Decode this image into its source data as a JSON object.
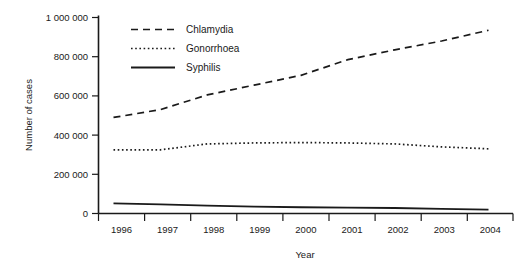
{
  "chart_data": {
    "type": "line",
    "title": "",
    "xlabel": "Year",
    "ylabel": "Number of cases",
    "x": [
      1996,
      1997,
      1998,
      1999,
      2000,
      2001,
      2002,
      2003,
      2004
    ],
    "xtick_labels": [
      "1996",
      "1997",
      "1998",
      "1999",
      "2000",
      "2001",
      "2002",
      "2003",
      "2004"
    ],
    "ytick_labels": [
      "0",
      "200 000",
      "400 000",
      "600 000",
      "800 000",
      "1 000 000"
    ],
    "ytick_values": [
      0,
      200000,
      400000,
      600000,
      800000,
      1000000
    ],
    "ylim": [
      0,
      1000000
    ],
    "xlim": [
      1996,
      2004
    ],
    "grid": false,
    "legend_position": "top-left-inside",
    "series": [
      {
        "name": "Chlamydia",
        "style": "dashed",
        "color": "#1a1a1a",
        "values": [
          490000,
          530000,
          605000,
          655000,
          705000,
          785000,
          835000,
          880000,
          935000
        ]
      },
      {
        "name": "Gonorrhoea",
        "style": "dotted",
        "color": "#1a1a1a",
        "values": [
          325000,
          325000,
          355000,
          360000,
          362000,
          360000,
          355000,
          340000,
          330000
        ]
      },
      {
        "name": "Syphilis",
        "style": "solid",
        "color": "#1a1a1a",
        "values": [
          52000,
          47000,
          40000,
          35000,
          32000,
          30000,
          28000,
          24000,
          20000
        ]
      }
    ]
  },
  "axes": {
    "x_title": "Year",
    "y_title": "Number of cases"
  },
  "legend": {
    "items": [
      {
        "label": "Chlamydia",
        "style": "dashed"
      },
      {
        "label": "Gonorrhoea",
        "style": "dotted"
      },
      {
        "label": "Syphilis",
        "style": "solid"
      }
    ]
  }
}
